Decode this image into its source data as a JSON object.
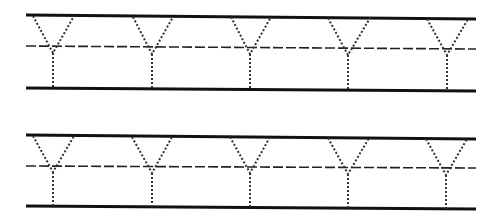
{
  "worksheet": {
    "letter": "Y",
    "colors": {
      "line": "#111111",
      "midline": "#222222",
      "trace": "#333333",
      "background": "#ffffff"
    },
    "rows": [
      {
        "top_line": {
          "x1": 26,
          "y1": 15,
          "x2": 476,
          "y2": 19
        },
        "mid_line": {
          "x1": 26,
          "y1": 46,
          "x2": 476,
          "y2": 49
        },
        "bottom_line": {
          "x1": 26,
          "y1": 88,
          "x2": 476,
          "y2": 91
        },
        "letters": [
          {
            "left_top": [
              33,
              16
            ],
            "right_top": [
              74,
              16
            ],
            "vertex": [
              53,
              53
            ],
            "stem_bottom": [
              53,
              88
            ]
          },
          {
            "left_top": [
              133,
              17
            ],
            "right_top": [
              173,
              17
            ],
            "vertex": [
              152,
              54
            ],
            "stem_bottom": [
              152,
              89
            ]
          },
          {
            "left_top": [
              231,
              17
            ],
            "right_top": [
              271,
              17
            ],
            "vertex": [
              250,
              54
            ],
            "stem_bottom": [
              250,
              89
            ]
          },
          {
            "left_top": [
              328,
              18
            ],
            "right_top": [
              370,
              18
            ],
            "vertex": [
              348,
              55
            ],
            "stem_bottom": [
              348,
              90
            ]
          },
          {
            "left_top": [
              427,
              19
            ],
            "right_top": [
              468,
              19
            ],
            "vertex": [
              447,
              55
            ],
            "stem_bottom": [
              447,
              91
            ]
          }
        ]
      },
      {
        "top_line": {
          "x1": 26,
          "y1": 135,
          "x2": 476,
          "y2": 139
        },
        "mid_line": {
          "x1": 26,
          "y1": 166,
          "x2": 476,
          "y2": 168
        },
        "bottom_line": {
          "x1": 26,
          "y1": 206,
          "x2": 476,
          "y2": 209
        },
        "letters": [
          {
            "left_top": [
              33,
              136
            ],
            "right_top": [
              74,
              136
            ],
            "vertex": [
              53,
              172
            ],
            "stem_bottom": [
              53,
              206
            ]
          },
          {
            "left_top": [
              132,
              137
            ],
            "right_top": [
              172,
              137
            ],
            "vertex": [
              152,
              173
            ],
            "stem_bottom": [
              152,
              207
            ]
          },
          {
            "left_top": [
              230,
              137
            ],
            "right_top": [
              270,
              137
            ],
            "vertex": [
              250,
              173
            ],
            "stem_bottom": [
              250,
              207
            ]
          },
          {
            "left_top": [
              328,
              138
            ],
            "right_top": [
              369,
              138
            ],
            "vertex": [
              348,
              174
            ],
            "stem_bottom": [
              348,
              208
            ]
          },
          {
            "left_top": [
              426,
              139
            ],
            "right_top": [
              467,
              139
            ],
            "vertex": [
              446,
              175
            ],
            "stem_bottom": [
              446,
              209
            ]
          }
        ]
      }
    ]
  }
}
